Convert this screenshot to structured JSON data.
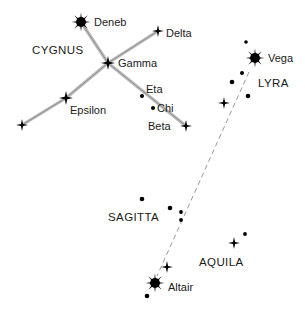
{
  "chart_data": {
    "type": "scatter",
    "xlabel": "",
    "ylabel": "",
    "xlim": [
      0,
      305
    ],
    "ylim": [
      0,
      311
    ],
    "grid": false,
    "legend": "none",
    "constellations": [
      {
        "name": "CYGNUS",
        "label_x": 32,
        "label_y": 54,
        "stars": [
          {
            "name": "Deneb",
            "x": 81,
            "y": 22,
            "magnitude_class": "bright",
            "radius": 9.5,
            "label_dx": 13,
            "label_dy": 4
          },
          {
            "name": "Delta",
            "x": 158,
            "y": 31,
            "magnitude_class": "medium",
            "radius": 6.0,
            "label_dx": 8,
            "label_dy": 6
          },
          {
            "name": "Gamma",
            "x": 108,
            "y": 63,
            "magnitude_class": "medium",
            "radius": 7.0,
            "label_dx": 10,
            "label_dy": 4
          },
          {
            "name": "Epsilon",
            "x": 66,
            "y": 98,
            "magnitude_class": "medium",
            "radius": 7.0,
            "label_dx": 4,
            "label_dy": 16
          },
          {
            "name": "Eta",
            "x": 142,
            "y": 96,
            "magnitude_class": "faint",
            "radius": 2.0,
            "label_dx": 4,
            "label_dy": -3
          },
          {
            "name": "Chi",
            "x": 153,
            "y": 108,
            "magnitude_class": "faint",
            "radius": 2.0,
            "label_dx": 4,
            "label_dy": 4
          },
          {
            "name": "Beta",
            "x": 186,
            "y": 126,
            "magnitude_class": "medium",
            "radius": 6.0,
            "label_dx": -38,
            "label_dy": 4
          },
          {
            "name": "",
            "x": 22,
            "y": 125,
            "magnitude_class": "medium",
            "radius": 6.0,
            "label_dx": 0,
            "label_dy": 0
          }
        ],
        "links": [
          [
            81,
            22,
            108,
            63
          ],
          [
            108,
            63,
            158,
            31
          ],
          [
            108,
            63,
            186,
            126
          ],
          [
            108,
            63,
            66,
            98
          ],
          [
            66,
            98,
            22,
            125
          ]
        ]
      },
      {
        "name": "LYRA",
        "label_x": 258,
        "label_y": 87,
        "stars": [
          {
            "name": "Vega",
            "x": 255,
            "y": 58,
            "magnitude_class": "bright",
            "radius": 9.5,
            "label_dx": 13,
            "label_dy": 4
          },
          {
            "name": "",
            "x": 246,
            "y": 42,
            "magnitude_class": "faint",
            "radius": 1.8,
            "label_dx": 0,
            "label_dy": 0
          },
          {
            "name": "",
            "x": 242,
            "y": 73,
            "magnitude_class": "faint",
            "radius": 2.0,
            "label_dx": 0,
            "label_dy": 0
          },
          {
            "name": "",
            "x": 232,
            "y": 82,
            "magnitude_class": "faint",
            "radius": 2.3,
            "label_dx": 0,
            "label_dy": 0
          },
          {
            "name": "",
            "x": 248,
            "y": 96,
            "magnitude_class": "faint",
            "radius": 2.3,
            "label_dx": 0,
            "label_dy": 0
          },
          {
            "name": "",
            "x": 224,
            "y": 103,
            "magnitude_class": "medium",
            "radius": 6.0,
            "label_dx": 0,
            "label_dy": 0
          }
        ],
        "links": []
      },
      {
        "name": "SAGITTA",
        "label_x": 108,
        "label_y": 221,
        "stars": [
          {
            "name": "",
            "x": 142,
            "y": 199,
            "magnitude_class": "faint",
            "radius": 2.3,
            "label_dx": 0,
            "label_dy": 0
          },
          {
            "name": "",
            "x": 170,
            "y": 208,
            "magnitude_class": "faint",
            "radius": 2.3,
            "label_dx": 0,
            "label_dy": 0
          },
          {
            "name": "",
            "x": 181,
            "y": 212,
            "magnitude_class": "faint",
            "radius": 1.9,
            "label_dx": 0,
            "label_dy": 0
          },
          {
            "name": "",
            "x": 181,
            "y": 220,
            "magnitude_class": "faint",
            "radius": 1.9,
            "label_dx": 0,
            "label_dy": 0
          }
        ],
        "links": []
      },
      {
        "name": "AQUILA",
        "label_x": 199,
        "label_y": 266,
        "stars": [
          {
            "name": "Altair",
            "x": 155,
            "y": 283,
            "magnitude_class": "bright",
            "radius": 9.5,
            "label_dx": 13,
            "label_dy": 8
          },
          {
            "name": "",
            "x": 167,
            "y": 267,
            "magnitude_class": "medium",
            "radius": 6.0,
            "label_dx": 0,
            "label_dy": 0
          },
          {
            "name": "",
            "x": 147,
            "y": 296,
            "magnitude_class": "faint",
            "radius": 2.3,
            "label_dx": 0,
            "label_dy": 0
          },
          {
            "name": "",
            "x": 234,
            "y": 243,
            "magnitude_class": "medium",
            "radius": 6.0,
            "label_dx": 0,
            "label_dy": 0
          },
          {
            "name": "",
            "x": 245,
            "y": 234,
            "magnitude_class": "faint",
            "radius": 1.9,
            "label_dx": 0,
            "label_dy": 0
          }
        ],
        "links": []
      }
    ],
    "guide_lines": [
      {
        "name": "vega-to-altair",
        "x1": 249,
        "y1": 72,
        "x2": 157,
        "y2": 276,
        "style": "dashed"
      }
    ]
  }
}
